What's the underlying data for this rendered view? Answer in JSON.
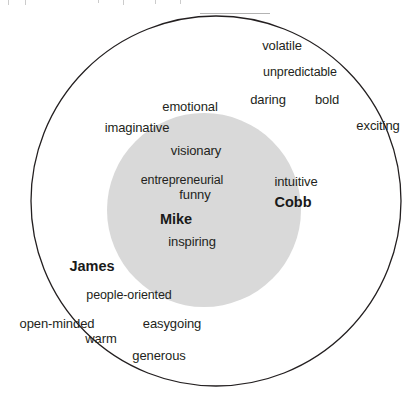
{
  "figure": {
    "type": "venn-word-cloud",
    "outer_circle": {
      "name": "outer-circle",
      "center_x": 216,
      "center_y": 201,
      "radius": 185,
      "fill": "#ffffff",
      "stroke": "#231f20",
      "stroke_width": 1.3
    },
    "inner_circle": {
      "name": "inner-circle",
      "center_x": 204,
      "center_y": 210,
      "radius": 97,
      "fill": "#d9d9d9",
      "stroke": "none"
    }
  },
  "people": [
    {
      "label": "Mike",
      "x": 176,
      "y": 219,
      "region": "inner-circle"
    },
    {
      "label": "Cobb",
      "x": 293,
      "y": 202,
      "region": "inner-circle"
    },
    {
      "label": "James",
      "x": 92,
      "y": 266,
      "region": "outer-circle"
    }
  ],
  "words": [
    {
      "label": "volatile",
      "x": 282,
      "y": 45,
      "region": "outside-circles"
    },
    {
      "label": "unpredictable",
      "x": 300,
      "y": 72,
      "region": "outside-circles"
    },
    {
      "label": "daring",
      "x": 268,
      "y": 99,
      "region": "outer-circle"
    },
    {
      "label": "bold",
      "x": 327,
      "y": 99,
      "region": "outside-circles"
    },
    {
      "label": "exciting",
      "x": 378,
      "y": 125,
      "region": "outside-circles"
    },
    {
      "label": "emotional",
      "x": 190,
      "y": 106,
      "region": "outer-circle"
    },
    {
      "label": "imaginative",
      "x": 137,
      "y": 127,
      "region": "outer-circle"
    },
    {
      "label": "visionary",
      "x": 196,
      "y": 150,
      "region": "inner-circle"
    },
    {
      "label": "entrepreneurial",
      "x": 182,
      "y": 180,
      "region": "inner-circle"
    },
    {
      "label": "funny",
      "x": 195,
      "y": 194,
      "region": "inner-circle"
    },
    {
      "label": "inspiring",
      "x": 192,
      "y": 241,
      "region": "inner-circle"
    },
    {
      "label": "intuitive",
      "x": 296,
      "y": 181,
      "region": "inner-circle"
    },
    {
      "label": "people-oriented",
      "x": 129,
      "y": 295,
      "region": "outer-circle"
    },
    {
      "label": "open-minded",
      "x": 57,
      "y": 323,
      "region": "outside-circles"
    },
    {
      "label": "easygoing",
      "x": 172,
      "y": 323,
      "region": "outer-circle"
    },
    {
      "label": "warm",
      "x": 101,
      "y": 338,
      "region": "outer-circle"
    },
    {
      "label": "generous",
      "x": 159,
      "y": 355,
      "region": "outer-circle"
    }
  ],
  "colors": {
    "ink": "#231f20",
    "inner_fill": "#d9d9d9",
    "page": "#ffffff"
  }
}
